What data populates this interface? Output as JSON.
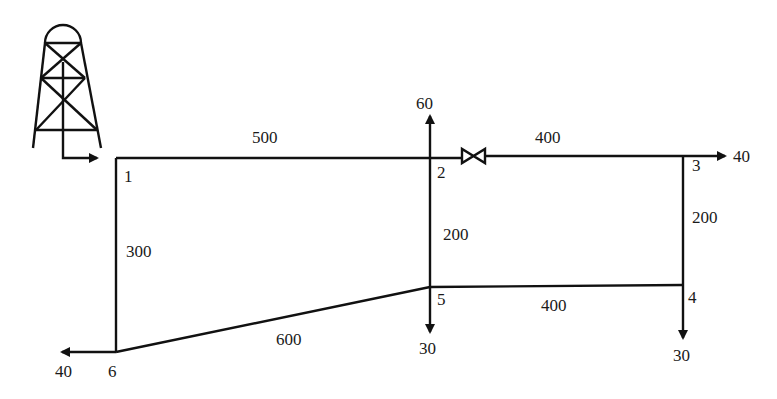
{
  "diagram": {
    "type": "pipe-network",
    "source": {
      "name": "water-tower"
    },
    "nodes": [
      {
        "id": "1",
        "label": "1",
        "x": 116,
        "y": 158
      },
      {
        "id": "2",
        "label": "2",
        "x": 430,
        "y": 158
      },
      {
        "id": "3",
        "label": "3",
        "x": 683,
        "y": 156
      },
      {
        "id": "4",
        "label": "4",
        "x": 683,
        "y": 285
      },
      {
        "id": "5",
        "label": "5",
        "x": 430,
        "y": 287
      },
      {
        "id": "6",
        "label": "6",
        "x": 116,
        "y": 352
      }
    ],
    "pipes": [
      {
        "from": "1",
        "to": "2",
        "length": "500"
      },
      {
        "from": "2",
        "to": "3",
        "length": "400",
        "valve": true
      },
      {
        "from": "3",
        "to": "4",
        "length": "200"
      },
      {
        "from": "2",
        "to": "5",
        "length": "200"
      },
      {
        "from": "5",
        "to": "4",
        "length": "400"
      },
      {
        "from": "1",
        "to": "6",
        "length": "300"
      },
      {
        "from": "6",
        "to": "5",
        "length": "600"
      }
    ],
    "demands": [
      {
        "node": "2",
        "value": "60",
        "direction": "up"
      },
      {
        "node": "3",
        "value": "40",
        "direction": "right"
      },
      {
        "node": "4",
        "value": "30",
        "direction": "down"
      },
      {
        "node": "5",
        "value": "30",
        "direction": "down"
      },
      {
        "node": "6",
        "value": "40",
        "direction": "left"
      }
    ],
    "labels": {
      "n1": "1",
      "n2": "2",
      "n3": "3",
      "n4": "4",
      "n5": "5",
      "n6": "6",
      "p12": "500",
      "p23": "400",
      "p34": "200",
      "p25": "200",
      "p54": "400",
      "p16": "300",
      "p65": "600",
      "q2": "60",
      "q3": "40",
      "q4": "30",
      "q5": "30",
      "q6": "40"
    }
  }
}
